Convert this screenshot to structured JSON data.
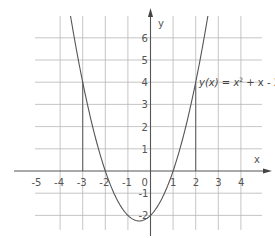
{
  "chart_data": {
    "type": "line",
    "title": "",
    "function": "y(x) = x^2 + x - 2",
    "annotation": {
      "label_prefix": "y(x) = x",
      "label_exp": "2",
      "label_suffix": " + x - 2"
    },
    "xlabel": "x",
    "ylabel": "y",
    "xlim": [
      -5,
      5
    ],
    "ylim": [
      -2.5,
      7
    ],
    "x_ticks": [
      -5,
      -4,
      -3,
      -2,
      -1,
      0,
      1,
      2,
      3,
      4
    ],
    "y_ticks": [
      -2,
      -1,
      1,
      2,
      3,
      4,
      5,
      6
    ],
    "x_tick_labels": [
      "-5",
      "-4",
      "-3",
      "-2",
      "-1",
      "0",
      "1",
      "2",
      "3",
      "4"
    ],
    "y_tick_labels": [
      "-2",
      "-1",
      "1",
      "2",
      "3",
      "4",
      "5",
      "6"
    ],
    "grid": true,
    "series": [
      {
        "name": "y(x) = x^2 + x - 2",
        "x": [
          -3.5,
          -3,
          -2.5,
          -2,
          -1.5,
          -1,
          -0.5,
          0,
          0.5,
          1,
          1.5,
          2,
          2.5
        ],
        "y": [
          6.75,
          4,
          1.75,
          0,
          -1.25,
          -2,
          -2.25,
          -2,
          -1.25,
          0,
          1.75,
          4,
          6.75
        ]
      }
    ],
    "highlighted_points": [
      {
        "x": -3,
        "y": 4,
        "note": "vertical guide from x-axis to curve"
      },
      {
        "x": 2,
        "y": 4,
        "note": "vertical guide from x-axis to curve"
      }
    ],
    "roots": [
      -2,
      1
    ],
    "vertex": {
      "x": -0.5,
      "y": -2.25
    },
    "y_intercept": -2
  }
}
